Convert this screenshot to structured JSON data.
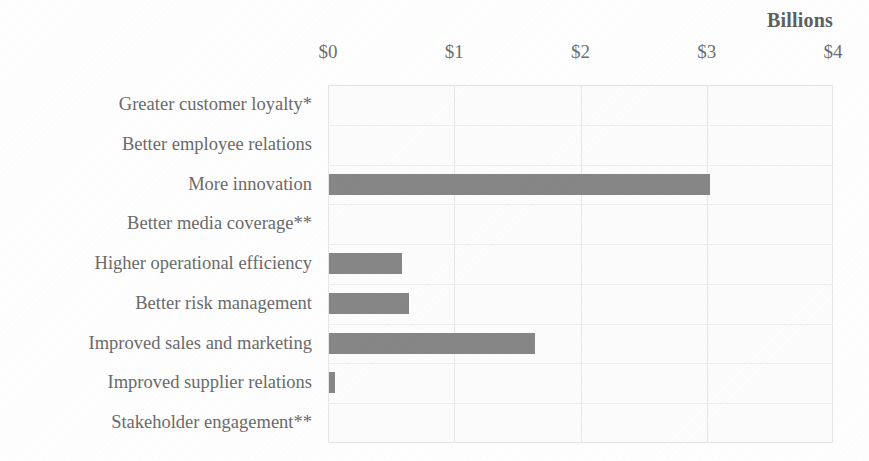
{
  "chart_data": {
    "type": "bar",
    "orientation": "horizontal",
    "title": "",
    "units_label": "Billions",
    "xlabel": "",
    "ylabel": "",
    "xlim": [
      0,
      4
    ],
    "xticks": [
      0,
      1,
      2,
      3,
      4
    ],
    "xtick_labels": [
      "$0",
      "$1",
      "$2",
      "$3",
      "$4"
    ],
    "grid": true,
    "legend": false,
    "bar_color": "#868686",
    "text_color": "#6a6a6a",
    "categories": [
      "Greater customer loyalty*",
      "Better employee relations",
      "More innovation",
      "Better media coverage**",
      "Higher operational efficiency",
      "Better risk management",
      "Improved sales and marketing",
      "Improved supplier relations",
      "Stakeholder engagement**"
    ],
    "values": [
      0,
      0,
      3.02,
      0,
      0.58,
      0.63,
      1.63,
      0.05,
      0
    ],
    "value_unit": "USD billions",
    "footnote_markers": [
      "*",
      "**"
    ]
  }
}
